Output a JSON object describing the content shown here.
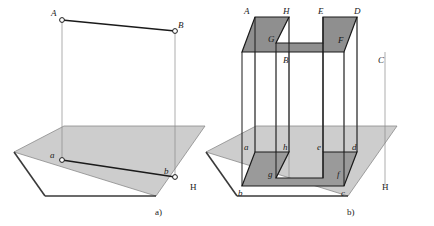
{
  "figure": {
    "background_color": "#ffffff",
    "panels": [
      {
        "id": "panel-a",
        "caption": "a)",
        "plane_label": "H",
        "object_kind": "line-segment",
        "upper_labels": [
          "A",
          "B"
        ],
        "lower_labels": [
          "a",
          "b"
        ]
      },
      {
        "id": "panel-b",
        "caption": "b)",
        "plane_label": "H",
        "object_kind": "u-shaped-polygon",
        "upper_labels": [
          "A",
          "H",
          "E",
          "D",
          "G",
          "F",
          "B",
          "C"
        ],
        "lower_labels": [
          "a",
          "h",
          "e",
          "d",
          "g",
          "f",
          "b",
          "c"
        ]
      }
    ]
  },
  "colors": {
    "plane_fill": "#cdcdcd",
    "plane_edge": "#8a8a8a",
    "plane_front_edge": "#3a3a3a",
    "top_face_fill": "#8f8f8f",
    "bottom_face_fill": "#9a9a9a",
    "outline": "#1a1a1a",
    "projector_line": "#8a8a8a",
    "marker_fill": "#ffffff",
    "label_color": "#1a1a1a"
  },
  "labels": {
    "a_upper_A": "A",
    "a_upper_B": "B",
    "a_lower_a": "a",
    "a_lower_b": "b",
    "a_plane_H": "H",
    "a_caption": "a)",
    "b_upper_A": "A",
    "b_upper_H": "H",
    "b_upper_E": "E",
    "b_upper_D": "D",
    "b_upper_G": "G",
    "b_upper_F": "F",
    "b_upper_B": "B",
    "b_upper_C": "C",
    "b_lower_a": "a",
    "b_lower_h": "h",
    "b_lower_e": "e",
    "b_lower_d": "d",
    "b_lower_g": "g",
    "b_lower_f": "f",
    "b_lower_b": "b",
    "b_lower_c": "c",
    "b_plane_H": "H",
    "b_caption": "b)"
  }
}
